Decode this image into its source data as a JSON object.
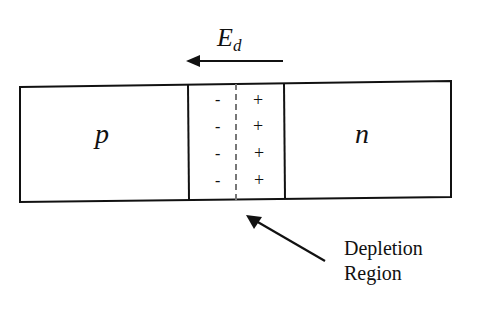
{
  "diagram": {
    "field": {
      "symbol": "E",
      "subscript": "d",
      "direction": "left"
    },
    "regions": [
      {
        "id": "p",
        "label": "p"
      },
      {
        "id": "depletion",
        "left_charges": [
          "-",
          "-",
          "-",
          "-"
        ],
        "right_charges": [
          "+",
          "+",
          "+",
          "+"
        ]
      },
      {
        "id": "n",
        "label": "n"
      }
    ],
    "callout": {
      "line1": "Depletion",
      "line2": "Region"
    },
    "colors": {
      "stroke": "#111111",
      "dashed_center": "#777777",
      "background": "#ffffff"
    }
  }
}
